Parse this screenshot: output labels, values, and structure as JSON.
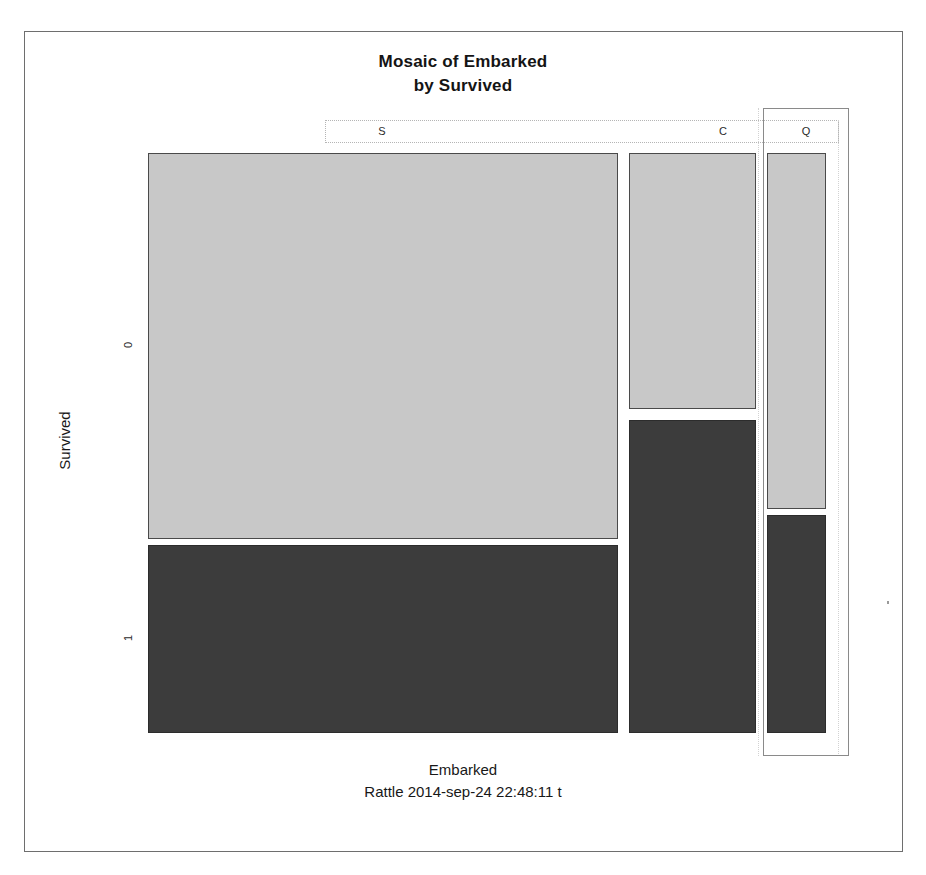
{
  "figure": {
    "title_line1": "Mosaic of Embarked",
    "title_line2": "by Survived",
    "x_axis_title": "Embarked",
    "y_axis_title": "Survived",
    "footer_stamp": "Rattle 2014-sep-24 22:48:11 t"
  },
  "axes": {
    "column_labels": [
      "S",
      "C",
      "Q"
    ],
    "row_labels": [
      "0",
      "1"
    ]
  },
  "colors": {
    "tile_light": "#c8c8c8",
    "tile_dark": "#3c3c3c",
    "tile_border": "#4a4a4a",
    "frame_border": "#6e6e6e",
    "guide_line": "#d2d2d2",
    "selection_border": "#8a8a8a",
    "background": "#ffffff",
    "text": "#181818"
  },
  "chart_data": {
    "type": "mosaic",
    "title": "Mosaic of Embarked by Survived",
    "xlabel": "Embarked",
    "ylabel": "Survived",
    "categories": [
      "S",
      "C",
      "Q"
    ],
    "rows": [
      "0",
      "1"
    ],
    "column_widths_frac": [
      0.717,
      0.194,
      0.09
    ],
    "cells": [
      {
        "column": "S",
        "row": "0",
        "fill": "light",
        "height_frac": 0.667,
        "rect_px": {
          "x": 148,
          "y": 153,
          "w": 470,
          "h": 386
        }
      },
      {
        "column": "S",
        "row": "1",
        "fill": "dark",
        "height_frac": 0.333,
        "rect_px": {
          "x": 148,
          "y": 545,
          "w": 470,
          "h": 188
        }
      },
      {
        "column": "C",
        "row": "0",
        "fill": "light",
        "height_frac": 0.447,
        "rect_px": {
          "x": 629,
          "y": 153,
          "w": 127,
          "h": 256
        }
      },
      {
        "column": "C",
        "row": "1",
        "fill": "dark",
        "height_frac": 0.553,
        "rect_px": {
          "x": 629,
          "y": 420,
          "w": 127,
          "h": 313
        }
      },
      {
        "column": "Q",
        "row": "0",
        "fill": "light",
        "height_frac": 0.614,
        "rect_px": {
          "x": 767,
          "y": 153,
          "w": 59,
          "h": 356
        }
      },
      {
        "column": "Q",
        "row": "1",
        "fill": "dark",
        "height_frac": 0.386,
        "rect_px": {
          "x": 767,
          "y": 515,
          "w": 59,
          "h": 218
        }
      }
    ],
    "highlighted_column": "Q",
    "legend": null,
    "grid": false
  }
}
